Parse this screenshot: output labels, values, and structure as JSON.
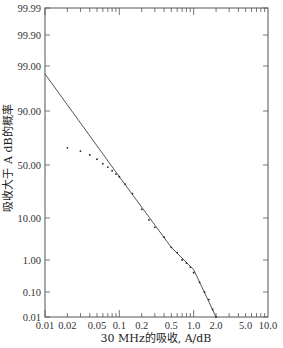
{
  "chart_data": {
    "type": "line",
    "title": "",
    "xlabel": "30 MHz的吸收, A/dB",
    "ylabel": "吸收大于 A dB的概率",
    "x_scale": "log",
    "y_scale": "probability",
    "xlim": [
      0.01,
      10.0
    ],
    "ylim": [
      0.01,
      99.99
    ],
    "grid": false,
    "legend": null,
    "x_ticks": [
      "0.01",
      "0.02",
      "0.05",
      "0.1",
      "0.2",
      "0.5",
      "1.0",
      "2.0",
      "5.0",
      "10.0"
    ],
    "x_tick_values": [
      0.01,
      0.02,
      0.05,
      0.1,
      0.2,
      0.5,
      1.0,
      2.0,
      5.0,
      10.0
    ],
    "y_ticks": [
      "99.99",
      "99.90",
      "99.00",
      "90.00",
      "50.00",
      "10.00",
      "1.00",
      "0.10",
      "0.01"
    ],
    "y_tick_values": [
      99.99,
      99.9,
      99.0,
      90.0,
      50.0,
      10.0,
      1.0,
      0.1,
      0.01
    ],
    "series": [
      {
        "name": "理论曲线",
        "style": "line",
        "x": [
          0.01,
          0.1,
          0.5,
          1.0,
          2.0
        ],
        "y": [
          98.5,
          35.0,
          2.0,
          0.5,
          0.01
        ]
      },
      {
        "name": "测量数据",
        "style": "scatter",
        "x": [
          0.02,
          0.03,
          0.04,
          0.05,
          0.06,
          0.07,
          0.08,
          0.09,
          0.1,
          0.12,
          0.15,
          0.2,
          0.25,
          0.3,
          0.4,
          0.5,
          0.6,
          0.7,
          0.8,
          0.9,
          1.0,
          1.2,
          1.4,
          1.6,
          1.8,
          2.0
        ],
        "y": [
          70.0,
          67.0,
          63.0,
          58.0,
          52.0,
          47.0,
          42.0,
          38.0,
          35.0,
          28.0,
          21.0,
          13.0,
          9.0,
          6.0,
          3.5,
          2.0,
          1.5,
          1.0,
          0.8,
          0.6,
          0.4,
          0.2,
          0.1,
          0.05,
          0.02,
          0.01
        ]
      }
    ]
  }
}
